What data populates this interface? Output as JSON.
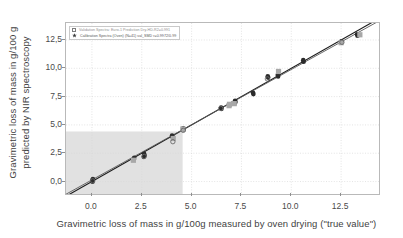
{
  "figure": {
    "background": "#ffffff",
    "frame_color": "#b9b9b9"
  },
  "axis_titles": {
    "x": "Gravimetric loss of mass in g/100g measured by oven drying (\"true value\")",
    "y_line1": "Gravimetric loss of mass in g/100 g",
    "y_line2": "predicted by NIR spectroscopy"
  },
  "legend": {
    "position": "top-left",
    "entries": [
      {
        "marker": "open-square",
        "marker_color": "#9a9a9a",
        "label": "Validation Spectra: Euro-1 Prediction Dry-HD-R2=0.991"
      },
      {
        "marker": "filled-star",
        "marker_color": "#3a3a3a",
        "label": "Calibration Spectra (Oven) (N=41) val_SMD  r=0.9972/0.99"
      }
    ]
  },
  "chart_data": {
    "type": "scatter",
    "title": "",
    "xlabel": "Gravimetric loss of mass in g/100g measured by oven drying (\"true value\")",
    "ylabel": "Gravimetric loss of mass in g/100 g predicted by NIR spectroscopy",
    "xlim": [
      -1.3,
      14.4
    ],
    "ylim": [
      -1.1,
      14.0
    ],
    "xticks": [
      0.0,
      2.5,
      5.0,
      7.5,
      10.0,
      12.5
    ],
    "xticklabels": [
      "0.0",
      "2.5",
      "5.0",
      "7.5",
      "10.0",
      "12.5"
    ],
    "yticks": [
      0.0,
      2.5,
      5.0,
      7.5,
      10.0,
      12.5
    ],
    "yticklabels": [
      "0,0",
      "2,5",
      "5,0",
      "7,5",
      "10,0",
      "12,5"
    ],
    "grid": true,
    "grid_color": "#d8d8d8",
    "grid_style": "dotted",
    "legend_position": "upper left",
    "shaded_region": {
      "label": "shaded-range-rectangle",
      "x_from": -1.3,
      "x_to": 4.55,
      "y_from": -1.1,
      "y_to": 4.42,
      "color": "#c9c9c9",
      "opacity": 0.55
    },
    "lines": [
      {
        "name": "identity-line",
        "color": "#1a1a1a",
        "width": 1.1,
        "x": [
          -1.3,
          14.4
        ],
        "y": [
          -1.3,
          14.4
        ]
      },
      {
        "name": "regression-line",
        "color": "#5a5a5a",
        "width": 0.9,
        "x": [
          -1.3,
          14.4
        ],
        "y": [
          -1.12,
          14.18
        ]
      }
    ],
    "series": [
      {
        "name": "Calibration Spectra",
        "marker": "circle-filled",
        "color": "#2b2b2b",
        "points": [
          [
            0.02,
            0.1
          ],
          [
            0.05,
            0.22
          ],
          [
            0.03,
            -0.02
          ],
          [
            2.1,
            1.96
          ],
          [
            2.12,
            2.1
          ],
          [
            2.62,
            2.44
          ],
          [
            2.64,
            2.3
          ],
          [
            2.6,
            2.18
          ],
          [
            4.02,
            4.06
          ],
          [
            4.05,
            3.92
          ],
          [
            4.58,
            4.7
          ],
          [
            4.6,
            4.6
          ],
          [
            6.48,
            6.54
          ],
          [
            6.5,
            6.42
          ],
          [
            6.92,
            6.8
          ],
          [
            7.18,
            7.14
          ],
          [
            7.2,
            7.02
          ],
          [
            7.16,
            6.92
          ],
          [
            8.08,
            7.84
          ],
          [
            8.1,
            7.72
          ],
          [
            8.82,
            9.3
          ],
          [
            8.84,
            9.18
          ],
          [
            9.32,
            9.4
          ],
          [
            9.34,
            9.28
          ],
          [
            10.6,
            10.72
          ],
          [
            10.62,
            10.58
          ],
          [
            12.52,
            12.38
          ],
          [
            13.3,
            13.0
          ],
          [
            13.32,
            12.88
          ]
        ]
      },
      {
        "name": "Validation Spectra",
        "marker": "square-filled",
        "color": "#a8a8a8",
        "points": [
          [
            2.08,
            1.88
          ],
          [
            4.08,
            3.8
          ],
          [
            4.56,
            4.64
          ],
          [
            6.88,
            6.7
          ],
          [
            6.9,
            6.82
          ],
          [
            7.14,
            6.88
          ],
          [
            9.36,
            9.72
          ],
          [
            12.5,
            12.26
          ],
          [
            13.44,
            12.96
          ]
        ]
      },
      {
        "name": "Validation Spectra (open)",
        "marker": "circle-open",
        "color": "#6a6a6a",
        "points": [
          [
            0.04,
            0.06
          ],
          [
            2.62,
            2.22
          ],
          [
            4.06,
            3.52
          ],
          [
            4.58,
            4.52
          ],
          [
            6.46,
            6.46
          ],
          [
            8.8,
            9.06
          ],
          [
            12.54,
            12.3
          ]
        ]
      }
    ]
  }
}
